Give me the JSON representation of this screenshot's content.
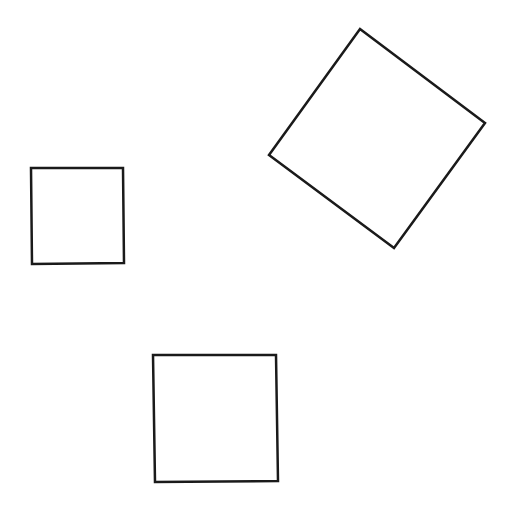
{
  "canvas": {
    "width": 515,
    "height": 510,
    "background": "#ffffff"
  },
  "stroke": {
    "color": "#1a1a1a",
    "width": 2.5
  },
  "shapes": [
    {
      "name": "rotated-square-top-right",
      "type": "polygon",
      "points": [
        [
          360,
          29
        ],
        [
          485,
          123
        ],
        [
          394,
          248
        ],
        [
          269,
          155
        ]
      ]
    },
    {
      "name": "small-square-left",
      "type": "polygon",
      "points": [
        [
          31,
          168
        ],
        [
          123,
          168
        ],
        [
          124,
          263
        ],
        [
          32,
          264
        ]
      ]
    },
    {
      "name": "square-bottom",
      "type": "polygon",
      "points": [
        [
          153,
          355
        ],
        [
          276,
          355
        ],
        [
          278,
          481
        ],
        [
          155,
          482
        ]
      ]
    }
  ]
}
